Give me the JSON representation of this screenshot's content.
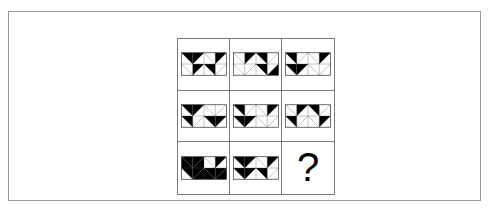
{
  "page": {
    "type": "visual-analogy-matrix-puzzle",
    "background_color": "#ffffff",
    "frame_color": "#9a9a9a",
    "grid_line_color": "#7a7a7a",
    "fill_color": "#000000",
    "empty_color": "#ffffff"
  },
  "matrix": {
    "rows": 3,
    "columns": 3,
    "tile_columns": 4,
    "tile_rows": 2,
    "cells": [
      {
        "id": "cell-1-1",
        "position": "row1-col1",
        "kind": "figure",
        "label": "figure-row1-col1",
        "tiles": [
          {
            "split": "tlbr",
            "filled": "upper"
          },
          {
            "split": "trbl",
            "filled": "upper"
          },
          {
            "split": "tlbr",
            "filled": "none"
          },
          {
            "split": "trbl",
            "filled": "upper"
          },
          {
            "split": "tlbr",
            "filled": "none"
          },
          {
            "split": "trbl",
            "filled": "upper"
          },
          {
            "split": "tlbr",
            "filled": "upper"
          },
          {
            "split": "trbl",
            "filled": "none"
          }
        ]
      },
      {
        "id": "cell-1-2",
        "position": "row1-col2",
        "kind": "figure",
        "label": "figure-row1-col2",
        "tiles": [
          {
            "split": "tlbr",
            "filled": "none"
          },
          {
            "split": "trbl",
            "filled": "upper"
          },
          {
            "split": "tlbr",
            "filled": "upper"
          },
          {
            "split": "trbl",
            "filled": "none"
          },
          {
            "split": "tlbr",
            "filled": "none"
          },
          {
            "split": "trbl",
            "filled": "none"
          },
          {
            "split": "tlbr",
            "filled": "upper"
          },
          {
            "split": "trbl",
            "filled": "lower"
          }
        ]
      },
      {
        "id": "cell-1-3",
        "position": "row1-col3",
        "kind": "figure",
        "label": "figure-row1-col3",
        "tiles": [
          {
            "split": "tlbr",
            "filled": "upper"
          },
          {
            "split": "trbl",
            "filled": "none"
          },
          {
            "split": "tlbr",
            "filled": "none"
          },
          {
            "split": "trbl",
            "filled": "upper"
          },
          {
            "split": "tlbr",
            "filled": "upper"
          },
          {
            "split": "trbl",
            "filled": "upper"
          },
          {
            "split": "tlbr",
            "filled": "none"
          },
          {
            "split": "trbl",
            "filled": "none"
          }
        ]
      },
      {
        "id": "cell-2-1",
        "position": "row2-col1",
        "kind": "figure",
        "label": "figure-row2-col1",
        "tiles": [
          {
            "split": "tlbr",
            "filled": "upper"
          },
          {
            "split": "trbl",
            "filled": "upper"
          },
          {
            "split": "tlbr",
            "filled": "none"
          },
          {
            "split": "trbl",
            "filled": "none"
          },
          {
            "split": "tlbr",
            "filled": "upper"
          },
          {
            "split": "trbl",
            "filled": "none"
          },
          {
            "split": "tlbr",
            "filled": "upper"
          },
          {
            "split": "trbl",
            "filled": "upper"
          }
        ]
      },
      {
        "id": "cell-2-2",
        "position": "row2-col2",
        "kind": "figure",
        "label": "figure-row2-col2",
        "tiles": [
          {
            "split": "tlbr",
            "filled": "upper"
          },
          {
            "split": "trbl",
            "filled": "none"
          },
          {
            "split": "tlbr",
            "filled": "none"
          },
          {
            "split": "trbl",
            "filled": "upper"
          },
          {
            "split": "tlbr",
            "filled": "upper"
          },
          {
            "split": "trbl",
            "filled": "upper"
          },
          {
            "split": "tlbr",
            "filled": "none"
          },
          {
            "split": "trbl",
            "filled": "none"
          }
        ]
      },
      {
        "id": "cell-2-3",
        "position": "row2-col3",
        "kind": "figure",
        "label": "figure-row2-col3",
        "tiles": [
          {
            "split": "tlbr",
            "filled": "none"
          },
          {
            "split": "trbl",
            "filled": "upper"
          },
          {
            "split": "tlbr",
            "filled": "upper"
          },
          {
            "split": "trbl",
            "filled": "none"
          },
          {
            "split": "tlbr",
            "filled": "upper"
          },
          {
            "split": "trbl",
            "filled": "none"
          },
          {
            "split": "tlbr",
            "filled": "none"
          },
          {
            "split": "trbl",
            "filled": "upper"
          }
        ]
      },
      {
        "id": "cell-3-1",
        "position": "row3-col1",
        "kind": "figure",
        "label": "figure-row3-col1",
        "tiles": [
          {
            "split": "tlbr",
            "filled": "both"
          },
          {
            "split": "trbl",
            "filled": "both"
          },
          {
            "split": "tlbr",
            "filled": "none"
          },
          {
            "split": "trbl",
            "filled": "upper"
          },
          {
            "split": "tlbr",
            "filled": "upper"
          },
          {
            "split": "trbl",
            "filled": "both"
          },
          {
            "split": "tlbr",
            "filled": "both"
          },
          {
            "split": "trbl",
            "filled": "both"
          }
        ]
      },
      {
        "id": "cell-3-2",
        "position": "row3-col2",
        "kind": "figure",
        "label": "figure-row3-col2",
        "tiles": [
          {
            "split": "tlbr",
            "filled": "upper"
          },
          {
            "split": "trbl",
            "filled": "upper"
          },
          {
            "split": "tlbr",
            "filled": "none"
          },
          {
            "split": "trbl",
            "filled": "upper"
          },
          {
            "split": "tlbr",
            "filled": "upper"
          },
          {
            "split": "trbl",
            "filled": "upper"
          },
          {
            "split": "tlbr",
            "filled": "upper"
          },
          {
            "split": "trbl",
            "filled": "none"
          }
        ]
      },
      {
        "id": "cell-3-3",
        "position": "row3-col3",
        "kind": "question",
        "label": "missing-answer-cell",
        "text": "?"
      }
    ]
  }
}
